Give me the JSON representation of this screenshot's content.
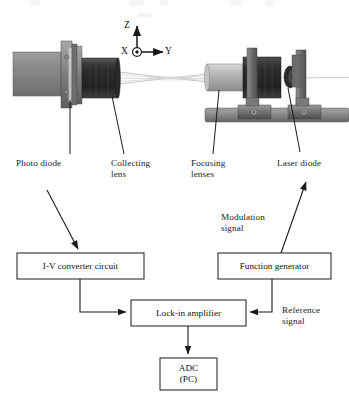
{
  "figure": {
    "type": "optical-measurement-system-schematic"
  },
  "axes": {
    "z_label": "Z",
    "y_label": "Y",
    "x_label": "X",
    "x_symbol": "out-of-page"
  },
  "hardware_labels": [
    {
      "id": "photo-diode",
      "text": "Photo diode"
    },
    {
      "id": "collecting-lens",
      "line1": "Collecting",
      "line2": "lens"
    },
    {
      "id": "focusing-lenses",
      "line1": "Focusing",
      "line2": "lenses"
    },
    {
      "id": "laser-diode",
      "text": "Laser diode"
    }
  ],
  "signal_labels": [
    {
      "id": "modulation-signal",
      "line1": "Modulation",
      "line2": "signal"
    },
    {
      "id": "reference-signal",
      "line1": "Reference",
      "line2": "signal"
    }
  ],
  "blocks": [
    {
      "id": "iv-converter",
      "text": "I-V converter circuit"
    },
    {
      "id": "function-generator",
      "text": "Function generator"
    },
    {
      "id": "lock-in-amplifier",
      "text": "Lock-in amplifier"
    },
    {
      "id": "adc-pc",
      "line1": "ADC",
      "line2": "(PC)"
    }
  ],
  "colors": {
    "stroke": "#1a1a1a",
    "background": "#ffffff",
    "body_gray": "#8d8d8d",
    "dark_gray": "#3a3a3a",
    "mid_gray": "#6a6a6a",
    "light_gray": "#b8b8b8",
    "beam": "#c9c9c9"
  }
}
